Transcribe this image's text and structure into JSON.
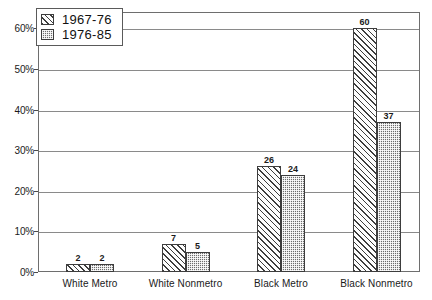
{
  "chart_data": {
    "type": "bar",
    "title": "",
    "subtitle": "",
    "xlabel": "",
    "ylabel": "",
    "categories": [
      "White  Metro",
      "White  Nonmetro",
      "Black  Metro",
      "Black  Nonmetro"
    ],
    "series": [
      {
        "name": "1967-76",
        "values": [
          2,
          7,
          26,
          60
        ],
        "pattern": "diagonal-hatch"
      },
      {
        "name": "1976-85",
        "values": [
          2,
          5,
          24,
          37
        ],
        "pattern": "checkerboard"
      }
    ],
    "ylim": [
      0,
      64
    ],
    "yticks": [
      0,
      10,
      20,
      30,
      40,
      50,
      60
    ],
    "ytick_labels": [
      "0%",
      "10%",
      "20%",
      "30%",
      "40%",
      "50%",
      "60%"
    ],
    "value_labels": [
      [
        "2",
        "7",
        "26",
        "60"
      ],
      [
        "2",
        "5",
        "24",
        "37"
      ]
    ],
    "grid": true,
    "grid_axis": "y",
    "legend_position": "top-left",
    "colors": {
      "axis": "#6e6e6e",
      "gridline": "#8a8a8a",
      "bar_outline": "#3d3d3d",
      "series_0_fill": "#fdfdfd",
      "series_1_fill": "#6d6d6d",
      "text": "#1a1a1a",
      "background": "#ffffff"
    }
  },
  "legend": {
    "items": [
      {
        "label": "1967-76"
      },
      {
        "label": "1976-85"
      }
    ]
  }
}
